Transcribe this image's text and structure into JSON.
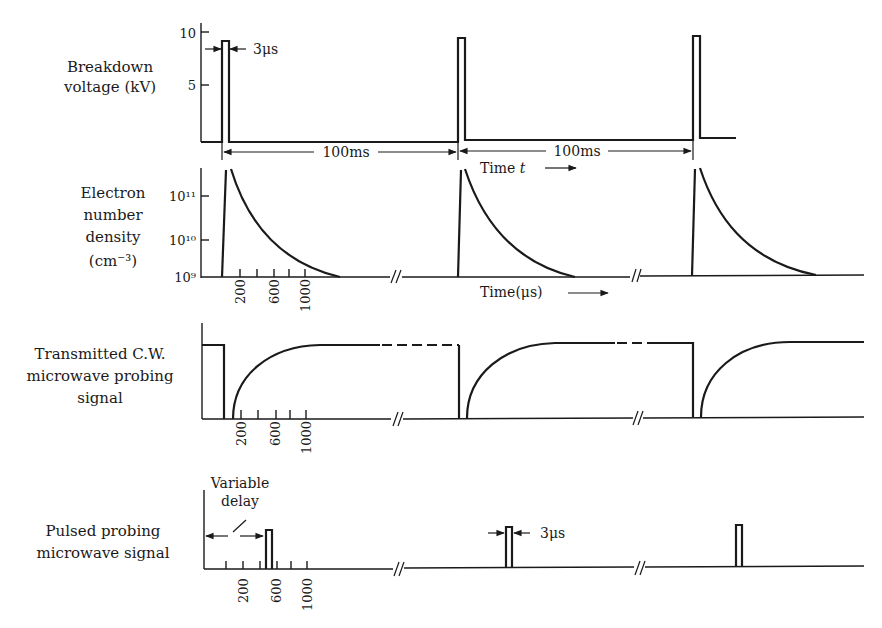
{
  "panels": [
    {
      "id": "breakdown",
      "label_lines": [
        "Breakdown",
        "voltage (kV)"
      ],
      "y_ticks": [
        "10",
        "5"
      ],
      "pulse_width_label": "3μs",
      "period_labels": [
        "100ms",
        "100ms"
      ],
      "time_axis_label": "Time t"
    },
    {
      "id": "electron-density",
      "label_lines": [
        "Electron",
        "number",
        "density",
        "(cm⁻³)"
      ],
      "y_ticks": [
        "10¹¹",
        "10¹⁰",
        "10⁹"
      ],
      "x_ticks": [
        "200",
        "600",
        "1000"
      ],
      "time_axis_label": "Time(μs)"
    },
    {
      "id": "transmitted-cw",
      "label_lines": [
        "Transmitted C.W.",
        "microwave probing",
        "signal"
      ],
      "x_ticks": [
        "200",
        "600",
        "1000"
      ]
    },
    {
      "id": "pulsed-probing",
      "label_lines": [
        "Pulsed probing",
        "microwave signal"
      ],
      "delay_label_lines": [
        "Variable",
        "delay"
      ],
      "pulse_width_label": "3μs",
      "x_ticks": [
        "200",
        "600",
        "1000"
      ]
    }
  ]
}
